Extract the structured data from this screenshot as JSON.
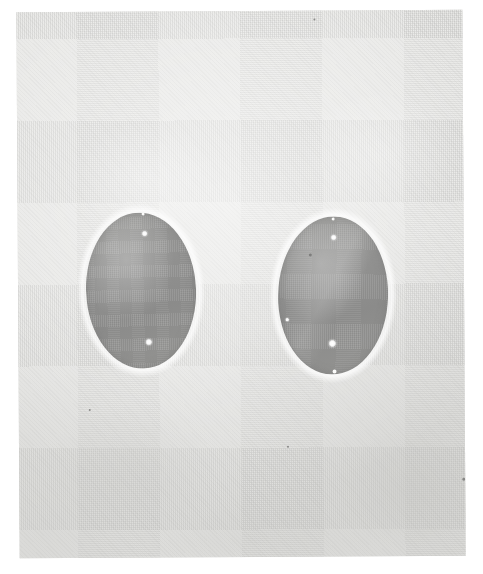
{
  "image": {
    "kind": "scanned-photographic-plate",
    "description": "Halftone photographic plate showing two dark grey oval specimens on a light grey textured paper background",
    "width_px": 483,
    "height_px": 574,
    "page_background_color": "#ffffff"
  },
  "plate": {
    "name": "photographic-plate",
    "left_px": 18,
    "top_px": 11,
    "width_px": 446,
    "height_px": 546,
    "rotation_deg": -0.35,
    "paper_color": "#e7e7e5",
    "paper_highlight_color": "#f2f2f0",
    "paper_shadow_color": "#c9c9c6"
  },
  "specimens": [
    {
      "name": "left-oval-specimen",
      "label": "Left specimen",
      "center_x_px": 141,
      "center_y_px": 290,
      "radius_x_px": 55,
      "radius_y_px": 78,
      "rotation_deg": -2,
      "fill_color": "#919190",
      "edge_color": "#7e7e7c",
      "spots": [
        {
          "name": "highlight-spot-top",
          "x_px": 145,
          "y_px": 233,
          "diameter_px": 6
        },
        {
          "name": "highlight-spot-bottom",
          "x_px": 148,
          "y_px": 341,
          "diameter_px": 7
        }
      ],
      "edge_nicks": [
        {
          "name": "edge-nick-top",
          "x_px": 143,
          "y_px": 213,
          "diameter_px": 3
        }
      ]
    },
    {
      "name": "right-oval-specimen",
      "label": "Right specimen",
      "center_x_px": 333,
      "center_y_px": 296,
      "radius_x_px": 55,
      "radius_y_px": 79,
      "rotation_deg": 1.5,
      "fill_color": "#949492",
      "edge_color": "#81817f",
      "spots": [
        {
          "name": "highlight-spot-top",
          "x_px": 334,
          "y_px": 238,
          "diameter_px": 6
        },
        {
          "name": "highlight-spot-bottom",
          "x_px": 332,
          "y_px": 344,
          "diameter_px": 8
        },
        {
          "name": "highlight-spot-left-edge",
          "x_px": 287,
          "y_px": 320,
          "diameter_px": 4
        }
      ],
      "edge_nicks": [
        {
          "name": "edge-nick-top",
          "x_px": 333,
          "y_px": 219,
          "diameter_px": 3
        },
        {
          "name": "edge-nick-bottom",
          "x_px": 334,
          "y_px": 372,
          "diameter_px": 4
        }
      ],
      "flecks": [
        {
          "name": "dark-fleck-upper-left",
          "x_px": 310,
          "y_px": 255,
          "diameter_px": 3
        }
      ]
    }
  ],
  "paper_marks": [
    {
      "name": "paper-fleck-top",
      "x_px": 315,
      "y_px": 19,
      "diameter_px": 2
    },
    {
      "name": "paper-fleck-right",
      "x_px": 461,
      "y_px": 479,
      "diameter_px": 3
    },
    {
      "name": "paper-fleck-bottom-left",
      "x_px": 88,
      "y_px": 408,
      "diameter_px": 2
    },
    {
      "name": "paper-fleck-mid-right",
      "x_px": 286,
      "y_px": 446,
      "diameter_px": 2
    }
  ],
  "paper_blotches": [
    {
      "name": "paper-blotch-upper-left",
      "x_px": 70,
      "y_px": 120,
      "w_px": 150,
      "h_px": 120,
      "color": "rgba(255,255,255,0.30)"
    },
    {
      "name": "paper-blotch-upper-right",
      "x_px": 300,
      "y_px": 90,
      "w_px": 160,
      "h_px": 130,
      "color": "rgba(255,255,255,0.26)"
    },
    {
      "name": "paper-blotch-center",
      "x_px": 200,
      "y_px": 250,
      "w_px": 110,
      "h_px": 140,
      "color": "rgba(234,234,232,0.35)"
    },
    {
      "name": "paper-blotch-lower-left",
      "x_px": 45,
      "y_px": 400,
      "w_px": 170,
      "h_px": 130,
      "color": "rgba(205,205,202,0.28)"
    },
    {
      "name": "paper-blotch-lower-right",
      "x_px": 330,
      "y_px": 430,
      "w_px": 160,
      "h_px": 120,
      "color": "rgba(200,200,197,0.30)"
    },
    {
      "name": "paper-blotch-bottom-band",
      "x_px": 120,
      "y_px": 500,
      "w_px": 260,
      "h_px": 80,
      "color": "rgba(198,198,195,0.22)"
    }
  ]
}
